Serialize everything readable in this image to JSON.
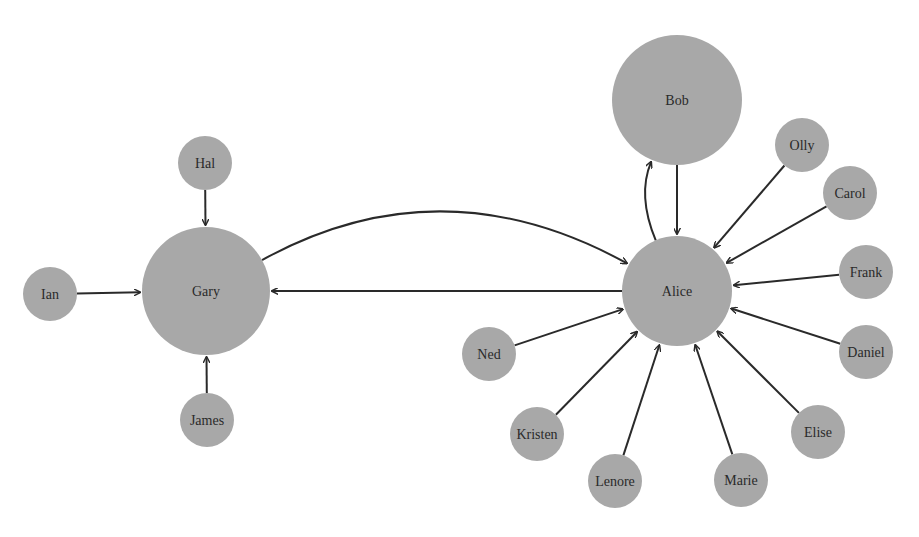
{
  "diagram": {
    "type": "directed-graph",
    "node_color": "#a8a8a8",
    "edge_color": "#2a2a2a",
    "nodes": [
      {
        "id": "Gary",
        "label": "Gary",
        "x": 206,
        "y": 291,
        "r": 64
      },
      {
        "id": "Hal",
        "label": "Hal",
        "x": 205,
        "y": 163,
        "r": 27
      },
      {
        "id": "Ian",
        "label": "Ian",
        "x": 50,
        "y": 294,
        "r": 27
      },
      {
        "id": "James",
        "label": "James",
        "x": 207,
        "y": 420,
        "r": 27
      },
      {
        "id": "Bob",
        "label": "Bob",
        "x": 677,
        "y": 100,
        "r": 65
      },
      {
        "id": "Alice",
        "label": "Alice",
        "x": 677,
        "y": 291,
        "r": 55
      },
      {
        "id": "Olly",
        "label": "Olly",
        "x": 802,
        "y": 145,
        "r": 27
      },
      {
        "id": "Carol",
        "label": "Carol",
        "x": 850,
        "y": 193,
        "r": 27
      },
      {
        "id": "Frank",
        "label": "Frank",
        "x": 866,
        "y": 272,
        "r": 27
      },
      {
        "id": "Daniel",
        "label": "Daniel",
        "x": 866,
        "y": 352,
        "r": 27
      },
      {
        "id": "Elise",
        "label": "Elise",
        "x": 818,
        "y": 432,
        "r": 27
      },
      {
        "id": "Marie",
        "label": "Marie",
        "x": 741,
        "y": 480,
        "r": 27
      },
      {
        "id": "Lenore",
        "label": "Lenore",
        "x": 615,
        "y": 481,
        "r": 27
      },
      {
        "id": "Kristen",
        "label": "Kristen",
        "x": 537,
        "y": 434,
        "r": 27
      },
      {
        "id": "Ned",
        "label": "Ned",
        "x": 489,
        "y": 354,
        "r": 27
      }
    ],
    "edges": [
      {
        "from": "Hal",
        "to": "Gary"
      },
      {
        "from": "Ian",
        "to": "Gary"
      },
      {
        "from": "James",
        "to": "Gary"
      },
      {
        "from": "Gary",
        "to": "Alice",
        "curved": true
      },
      {
        "from": "Alice",
        "to": "Gary"
      },
      {
        "from": "Bob",
        "to": "Alice"
      },
      {
        "from": "Alice",
        "to": "Bob",
        "curved": true
      },
      {
        "from": "Olly",
        "to": "Alice"
      },
      {
        "from": "Carol",
        "to": "Alice"
      },
      {
        "from": "Frank",
        "to": "Alice"
      },
      {
        "from": "Daniel",
        "to": "Alice"
      },
      {
        "from": "Elise",
        "to": "Alice"
      },
      {
        "from": "Marie",
        "to": "Alice"
      },
      {
        "from": "Lenore",
        "to": "Alice"
      },
      {
        "from": "Kristen",
        "to": "Alice"
      },
      {
        "from": "Ned",
        "to": "Alice"
      }
    ]
  }
}
